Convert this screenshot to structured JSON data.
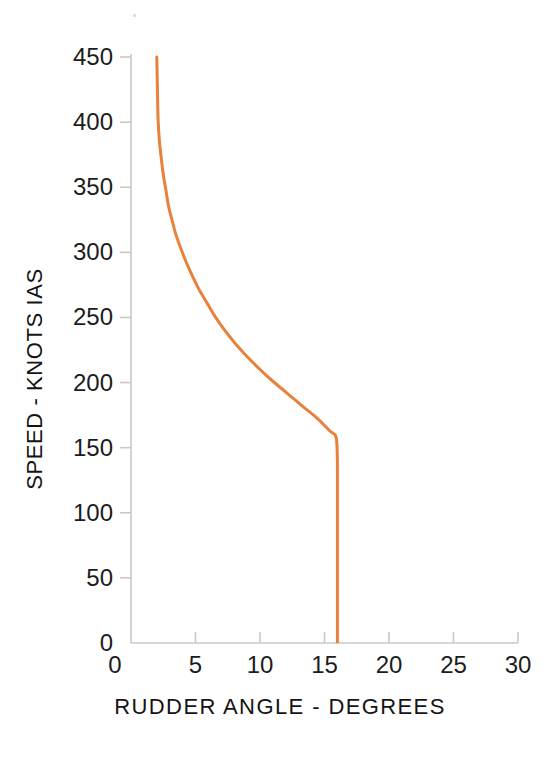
{
  "chart_data": {
    "type": "line",
    "title": "",
    "subtitle": "",
    "xlabel": "RUDDER ANGLE - DEGREES",
    "ylabel": "SPEED - KNOTS IAS",
    "xlim": [
      0,
      30
    ],
    "ylim": [
      0,
      450
    ],
    "xticks": [
      0,
      5,
      10,
      15,
      20,
      25,
      30
    ],
    "yticks": [
      0,
      50,
      100,
      150,
      200,
      250,
      300,
      350,
      400,
      450
    ],
    "xtick_labels": [
      "0",
      "5",
      "10",
      "15",
      "20",
      "25",
      "30"
    ],
    "ytick_labels": [
      "0",
      "50",
      "100",
      "150",
      "200",
      "250",
      "300",
      "350",
      "400",
      "450"
    ],
    "grid": false,
    "legend": false,
    "legend_position": "none",
    "series": [
      {
        "name": "Rudder authority limit",
        "color": "#e8813a",
        "line_width": 3,
        "x": [
          16.0,
          16.0,
          15.9,
          15.4,
          14.5,
          13.4,
          12.2,
          11.0,
          9.9,
          8.9,
          8.0,
          7.2,
          6.5,
          5.9,
          5.3,
          4.8,
          4.3,
          3.9,
          3.5,
          3.2,
          2.9,
          2.7,
          2.5,
          2.35,
          2.2,
          2.1,
          2.05,
          2.0
        ],
        "y": [
          0,
          140,
          158,
          163,
          172,
          181,
          191,
          201,
          211,
          221,
          231,
          241,
          251,
          261,
          271,
          281,
          292,
          302,
          313,
          324,
          336,
          348,
          360,
          372,
          386,
          402,
          424,
          450
        ]
      }
    ],
    "annotations": [],
    "axis_color": "#c9c9c9",
    "tick_color": "#c9c9c9",
    "text_color": "#1c1c1c",
    "background": "#ffffff"
  },
  "geometry": {
    "plot_left_px": 131,
    "plot_right_px": 518,
    "plot_bottom_px": 643,
    "plot_top_px": 57
  }
}
